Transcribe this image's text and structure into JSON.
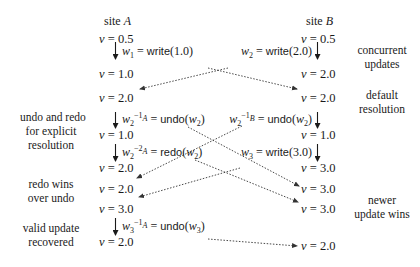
{
  "sites": {
    "a": {
      "label_prefix": "site",
      "label_name": "A"
    },
    "b": {
      "label_prefix": "site",
      "label_name": "B"
    }
  },
  "site_a_states": [
    {
      "var": "v",
      "eq": "=",
      "value": "0.5"
    },
    {
      "var": "v",
      "eq": "=",
      "value": "1.0"
    },
    {
      "var": "v",
      "eq": "=",
      "value": "2.0"
    },
    {
      "var": "v",
      "eq": "=",
      "value": "1.0"
    },
    {
      "var": "v",
      "eq": "=",
      "value": "2.0"
    },
    {
      "var": "v",
      "eq": "=",
      "value": "2.0"
    },
    {
      "var": "v",
      "eq": "=",
      "value": "3.0"
    },
    {
      "var": "v",
      "eq": "=",
      "value": "2.0"
    }
  ],
  "site_b_states": [
    {
      "var": "v",
      "eq": "=",
      "value": "0.5"
    },
    {
      "var": "v",
      "eq": "=",
      "value": "2.0"
    },
    {
      "var": "v",
      "eq": "=",
      "value": "2.0"
    },
    {
      "var": "v",
      "eq": "=",
      "value": "1.0"
    },
    {
      "var": "v",
      "eq": "=",
      "value": "3.0"
    },
    {
      "var": "v",
      "eq": "=",
      "value": "3.0"
    },
    {
      "var": "v",
      "eq": "=",
      "value": "3.0"
    },
    {
      "var": "v",
      "eq": "=",
      "value": "2.0"
    }
  ],
  "site_a_ops": [
    {
      "lhs": "w",
      "sub": "1",
      "sup": "",
      "eq": "=",
      "fn": "write",
      "arg": "1.0",
      "arg_is_var": false,
      "arg_sub": ""
    },
    {
      "lhs": "w",
      "sub": "2",
      "sup": "−1",
      "sup_site": "A",
      "eq": "=",
      "fn": "undo",
      "arg": "w",
      "arg_is_var": true,
      "arg_sub": "2"
    },
    {
      "lhs": "w",
      "sub": "2",
      "sup": "−2",
      "sup_site": "A",
      "eq": "=",
      "fn": "redo",
      "arg": "w",
      "arg_is_var": true,
      "arg_sub": "2"
    },
    {
      "lhs": "w",
      "sub": "3",
      "sup": "−1",
      "sup_site": "A",
      "eq": "=",
      "fn": "undo",
      "arg": "w",
      "arg_is_var": true,
      "arg_sub": "3"
    }
  ],
  "site_b_ops": [
    {
      "lhs": "w",
      "sub": "2",
      "sup": "",
      "eq": "=",
      "fn": "write",
      "arg": "2.0",
      "arg_is_var": false,
      "arg_sub": ""
    },
    {
      "lhs": "w",
      "sub": "2",
      "sup": "−1",
      "sup_site": "B",
      "eq": "=",
      "fn": "undo",
      "arg": "w",
      "arg_is_var": true,
      "arg_sub": "2"
    },
    {
      "lhs": "w",
      "sub": "3",
      "sup": "",
      "eq": "=",
      "fn": "write",
      "arg": "3.0",
      "arg_is_var": false,
      "arg_sub": ""
    }
  ],
  "annotations_left": [
    {
      "lines": [
        "undo and redo",
        "for explicit",
        "resolution"
      ]
    },
    {
      "lines": [
        "redo wins",
        "over undo"
      ]
    },
    {
      "lines": [
        "valid update",
        "recovered"
      ]
    }
  ],
  "annotations_right": [
    {
      "lines": [
        "concurrent",
        "updates"
      ]
    },
    {
      "lines": [
        "default",
        "resolution"
      ]
    },
    {
      "lines": [
        "newer",
        "update wins"
      ]
    }
  ],
  "messages": [
    {
      "from": "A: w1 = write(1.0)",
      "to": "B: v = 2.0 (default resolution)"
    },
    {
      "from": "B: w2 = write(2.0)",
      "to": "A: v = 2.0"
    },
    {
      "from": "A: undo(w2)",
      "to": "B: v = 3.0 (newer update wins)"
    },
    {
      "from": "B: undo(w2)",
      "to": "A: v = 2.0 (redo wins over undo)"
    },
    {
      "from": "A: redo(w2)",
      "to": "B: v = 3.0"
    },
    {
      "from": "B: w3 = write(3.0)",
      "to": "A: v = 3.0"
    },
    {
      "from": "A: undo(w3)",
      "to": "B: v = 2.0"
    }
  ],
  "colors": {
    "ink": "#1a1a1a",
    "dotted": "#333333",
    "background": "#ffffff"
  }
}
